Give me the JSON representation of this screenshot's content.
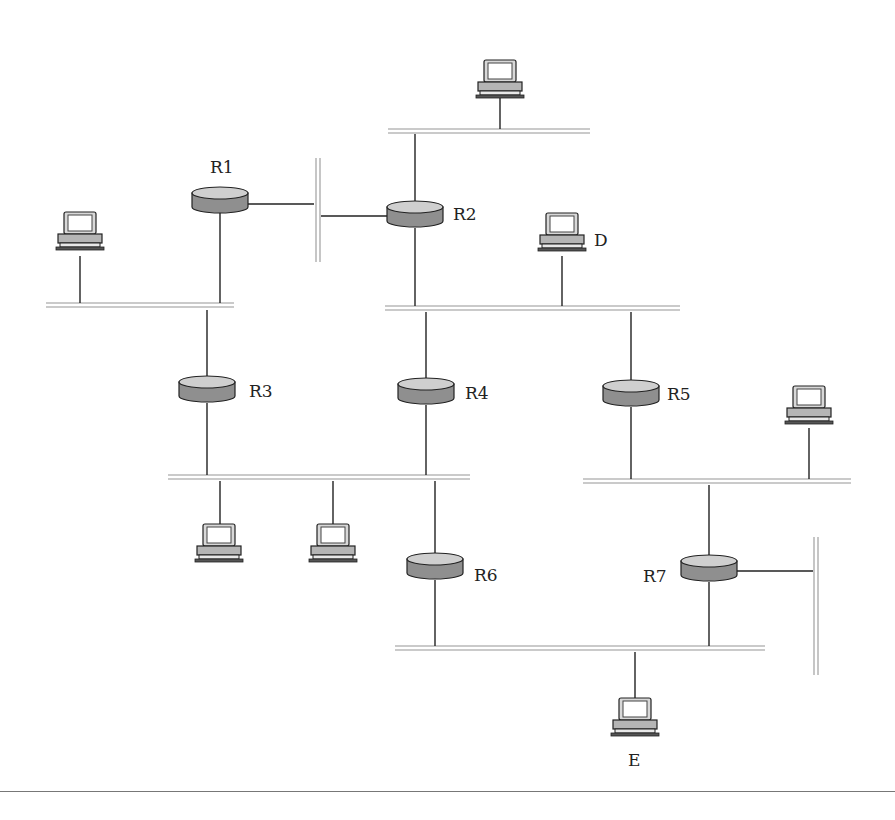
{
  "figure": {
    "type": "network-topology",
    "colors": {
      "router_body": "#8f8f8f",
      "router_top": "#cfcfcf",
      "segment": "#b8b8b8",
      "link": "#222222",
      "host_body": "#b5b5b5",
      "host_screen": "#ffffff"
    }
  },
  "routers": [
    {
      "id": "R1",
      "label": "R1",
      "x": 220,
      "y": 200,
      "label_x": 210,
      "label_y": 159
    },
    {
      "id": "R2",
      "label": "R2",
      "x": 415,
      "y": 214,
      "label_x": 453,
      "label_y": 206
    },
    {
      "id": "R3",
      "label": "R3",
      "x": 207,
      "y": 389,
      "label_x": 249,
      "label_y": 383
    },
    {
      "id": "R4",
      "label": "R4",
      "x": 426,
      "y": 391,
      "label_x": 465,
      "label_y": 385
    },
    {
      "id": "R5",
      "label": "R5",
      "x": 631,
      "y": 393,
      "label_x": 667,
      "label_y": 386
    },
    {
      "id": "R6",
      "label": "R6",
      "x": 435,
      "y": 566,
      "label_x": 474,
      "label_y": 567
    },
    {
      "id": "R7",
      "label": "R7",
      "x": 709,
      "y": 568,
      "label_x": 643,
      "label_y": 568
    }
  ],
  "hosts": [
    {
      "id": "host-top",
      "label": "",
      "x": 500,
      "y": 82
    },
    {
      "id": "host-left",
      "label": "",
      "x": 80,
      "y": 234
    },
    {
      "id": "host-D",
      "label": "D",
      "x": 562,
      "y": 235,
      "label_x": 594,
      "label_y": 232
    },
    {
      "id": "host-right",
      "label": "",
      "x": 809,
      "y": 408
    },
    {
      "id": "host-bl1",
      "label": "",
      "x": 219,
      "y": 546
    },
    {
      "id": "host-bl2",
      "label": "",
      "x": 333,
      "y": 546
    },
    {
      "id": "host-E",
      "label": "E",
      "x": 635,
      "y": 720,
      "label_x": 628,
      "label_y": 752
    }
  ],
  "segments": [
    {
      "id": "net-top",
      "orient": "h",
      "x1": 388,
      "x2": 590,
      "y": 131
    },
    {
      "id": "net-r1r2",
      "orient": "v",
      "x": 318,
      "y1": 158,
      "y2": 262
    },
    {
      "id": "net-left",
      "orient": "h",
      "x1": 46,
      "x2": 234,
      "y": 305
    },
    {
      "id": "net-mid",
      "orient": "h",
      "x1": 385,
      "x2": 680,
      "y": 308
    },
    {
      "id": "net-lower-left",
      "orient": "h",
      "x1": 168,
      "x2": 470,
      "y": 477
    },
    {
      "id": "net-lower-right",
      "orient": "h",
      "x1": 583,
      "x2": 851,
      "y": 481
    },
    {
      "id": "net-right-vert",
      "orient": "v",
      "x": 816,
      "y1": 537,
      "y2": 675
    },
    {
      "id": "net-bottom",
      "orient": "h",
      "x1": 395,
      "x2": 765,
      "y": 648
    }
  ],
  "links": [
    {
      "from": "host-top",
      "x1": 500,
      "y1": 94,
      "x2": 500,
      "y2": 129
    },
    {
      "from": "net-top",
      "x1": 415,
      "y1": 134,
      "x2": 415,
      "y2": 205
    },
    {
      "from": "R1",
      "x1": 248,
      "y1": 204,
      "x2": 314,
      "y2": 204
    },
    {
      "from": "R2",
      "x1": 321,
      "y1": 216,
      "x2": 388,
      "y2": 216
    },
    {
      "from": "R1",
      "x1": 220,
      "y1": 213,
      "x2": 220,
      "y2": 303
    },
    {
      "from": "host-left",
      "x1": 80,
      "y1": 256,
      "x2": 80,
      "y2": 303
    },
    {
      "from": "R2",
      "x1": 415,
      "y1": 228,
      "x2": 415,
      "y2": 306
    },
    {
      "from": "host-D",
      "x1": 562,
      "y1": 256,
      "x2": 562,
      "y2": 306
    },
    {
      "from": "net-left",
      "x1": 207,
      "y1": 310,
      "x2": 207,
      "y2": 380
    },
    {
      "from": "R3",
      "x1": 207,
      "y1": 403,
      "x2": 207,
      "y2": 475
    },
    {
      "from": "net-mid",
      "x1": 426,
      "y1": 312,
      "x2": 426,
      "y2": 382
    },
    {
      "from": "R4",
      "x1": 426,
      "y1": 405,
      "x2": 426,
      "y2": 475
    },
    {
      "from": "net-mid",
      "x1": 631,
      "y1": 312,
      "x2": 631,
      "y2": 384
    },
    {
      "from": "R5",
      "x1": 631,
      "y1": 407,
      "x2": 631,
      "y2": 479
    },
    {
      "from": "host-right",
      "x1": 809,
      "y1": 428,
      "x2": 809,
      "y2": 479
    },
    {
      "from": "net-lower-left",
      "x1": 220,
      "y1": 481,
      "x2": 220,
      "y2": 527
    },
    {
      "from": "net-lower-left",
      "x1": 333,
      "y1": 481,
      "x2": 333,
      "y2": 527
    },
    {
      "from": "net-lower-left",
      "x1": 435,
      "y1": 481,
      "x2": 435,
      "y2": 557
    },
    {
      "from": "R6",
      "x1": 435,
      "y1": 580,
      "x2": 435,
      "y2": 646
    },
    {
      "from": "net-lower-right",
      "x1": 709,
      "y1": 485,
      "x2": 709,
      "y2": 559
    },
    {
      "from": "R7",
      "x1": 737,
      "y1": 571,
      "x2": 813,
      "y2": 571
    },
    {
      "from": "R7",
      "x1": 709,
      "y1": 582,
      "x2": 709,
      "y2": 646
    },
    {
      "from": "net-bottom",
      "x1": 635,
      "y1": 652,
      "x2": 635,
      "y2": 700
    }
  ]
}
